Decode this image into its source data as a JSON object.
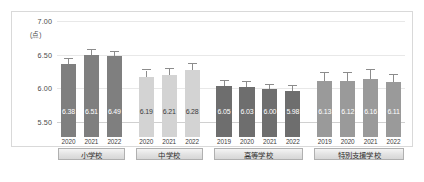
{
  "chart_data": {
    "type": "bar",
    "title": "",
    "subtitle": "",
    "xlabel": "",
    "ylabel": "",
    "unit_label": "(点)",
    "ylim": [
      5.5,
      7.0
    ],
    "yticks": [
      "7.00",
      "6.50",
      "6.00",
      "5.50"
    ],
    "ytick_values": [
      7.0,
      6.5,
      6.0,
      5.5
    ],
    "grid": true,
    "legend": "none",
    "error_bars": true,
    "groups": [
      {
        "label": "小学校",
        "color": "#7f7f7f",
        "categories": [
          "2020",
          "2021",
          "2022"
        ],
        "values": [
          6.38,
          6.51,
          6.49
        ],
        "value_labels": [
          "6.38",
          "6.51",
          "6.49"
        ],
        "err_upper": [
          0.07,
          0.07,
          0.07
        ],
        "err_lower": [
          0.07,
          0.07,
          0.07
        ]
      },
      {
        "label": "中学校",
        "color": "#d3d3d3",
        "categories": [
          "2020",
          "2021",
          "2022"
        ],
        "values": [
          6.19,
          6.21,
          6.28
        ],
        "value_labels": [
          "6.19",
          "6.21",
          "6.28"
        ],
        "err_upper": [
          0.09,
          0.09,
          0.09
        ],
        "err_lower": [
          0.09,
          0.09,
          0.09
        ]
      },
      {
        "label": "高等学校",
        "color": "#6e6e6e",
        "categories": [
          "2019",
          "2020",
          "2021",
          "2022"
        ],
        "values": [
          6.05,
          6.03,
          6.0,
          5.98
        ],
        "value_labels": [
          "6.05",
          "6.03",
          "6.00",
          "5.98"
        ],
        "err_upper": [
          0.08,
          0.08,
          0.07,
          0.07
        ],
        "err_lower": [
          0.08,
          0.08,
          0.07,
          0.07
        ]
      },
      {
        "label": "特別支援学校",
        "color": "#9a9a9a",
        "categories": [
          "2019",
          "2020",
          "2021",
          "2022"
        ],
        "values": [
          6.13,
          6.12,
          6.16,
          6.11
        ],
        "value_labels": [
          "6.13",
          "6.12",
          "6.16",
          "6.11"
        ],
        "err_upper": [
          0.11,
          0.12,
          0.13,
          0.1
        ],
        "err_lower": [
          0.11,
          0.12,
          0.13,
          0.1
        ]
      }
    ]
  }
}
